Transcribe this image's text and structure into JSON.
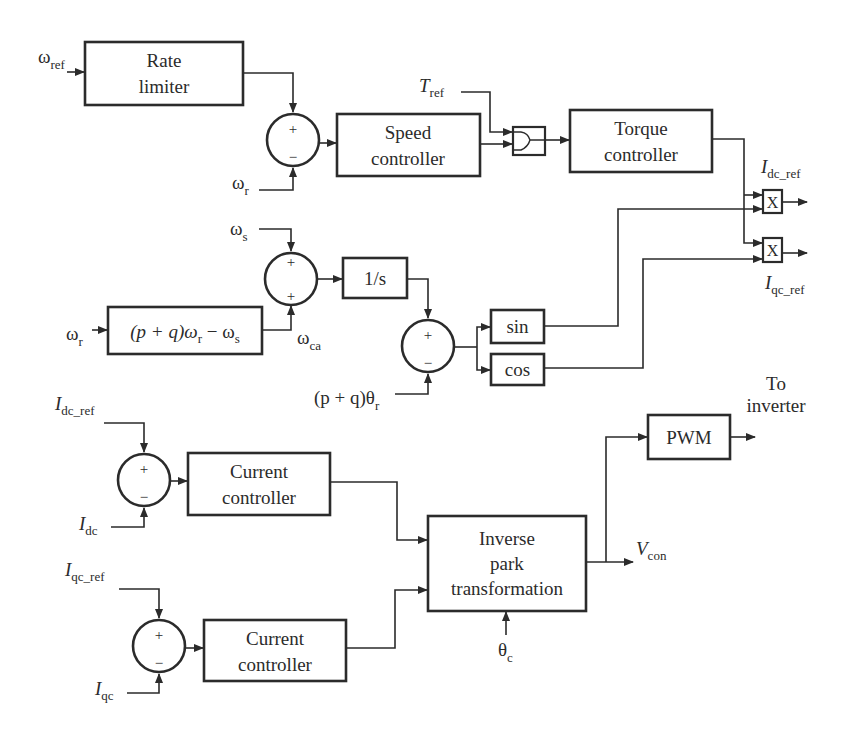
{
  "blocks": {
    "rate_limiter": {
      "line1": "Rate",
      "line2": "limiter"
    },
    "speed_controller": {
      "line1": "Speed",
      "line2": "controller"
    },
    "torque_controller": {
      "line1": "Torque",
      "line2": "controller"
    },
    "slip_calc": {
      "text": "(p + q)ω",
      "sub": "r",
      "rest": " − ω",
      "sub2": "s"
    },
    "integrator": {
      "text": "1/s"
    },
    "sin": {
      "text": "sin"
    },
    "cos": {
      "text": "cos"
    },
    "multiplier_d": {
      "text": "X"
    },
    "multiplier_q": {
      "text": "X"
    },
    "current_controller_d": {
      "line1": "Current",
      "line2": "controller"
    },
    "current_controller_q": {
      "line1": "Current",
      "line2": "controller"
    },
    "inverse_park": {
      "line1": "Inverse",
      "line2": "park",
      "line3": "transformation"
    },
    "pwm": {
      "text": "PWM"
    }
  },
  "signals": {
    "omega_ref": {
      "base": "ω",
      "sub": "ref"
    },
    "omega_r_fb": {
      "base": "ω",
      "sub": "r"
    },
    "t_ref": {
      "base": "T",
      "sub": "ref"
    },
    "omega_s": {
      "base": "ω",
      "sub": "s"
    },
    "omega_r_in": {
      "base": "ω",
      "sub": "r"
    },
    "omega_ca": {
      "base": "ω",
      "sub": "ca"
    },
    "theta_r": {
      "base": "(p + q)θ",
      "sub": "r"
    },
    "idc_ref_out": {
      "base": "I",
      "sub": "dc_ref"
    },
    "iqc_ref_out": {
      "base": "I",
      "sub": "qc_ref"
    },
    "idc_ref_in": {
      "base": "I",
      "sub": "dc_ref"
    },
    "idc": {
      "base": "I",
      "sub": "dc"
    },
    "iqc_ref_in": {
      "base": "I",
      "sub": "qc_ref"
    },
    "iqc": {
      "base": "I",
      "sub": "qc"
    },
    "v_con": {
      "base": "V",
      "sub": "con"
    },
    "theta_c": {
      "base": "θ",
      "sub": "c"
    },
    "to_inverter": {
      "line1": "To",
      "line2": "inverter"
    }
  },
  "summing_junctions": {
    "speed_error": {
      "top": "+",
      "bottom": "−"
    },
    "slip_sum": {
      "top": "+",
      "bottom": "+"
    },
    "angle_error": {
      "top": "+",
      "bottom": "−"
    },
    "id_error": {
      "top": "+",
      "bottom": "−"
    },
    "iq_error": {
      "top": "+",
      "bottom": "−"
    }
  },
  "colors": {
    "ink": "#2b2b2b",
    "background": "#ffffff"
  }
}
